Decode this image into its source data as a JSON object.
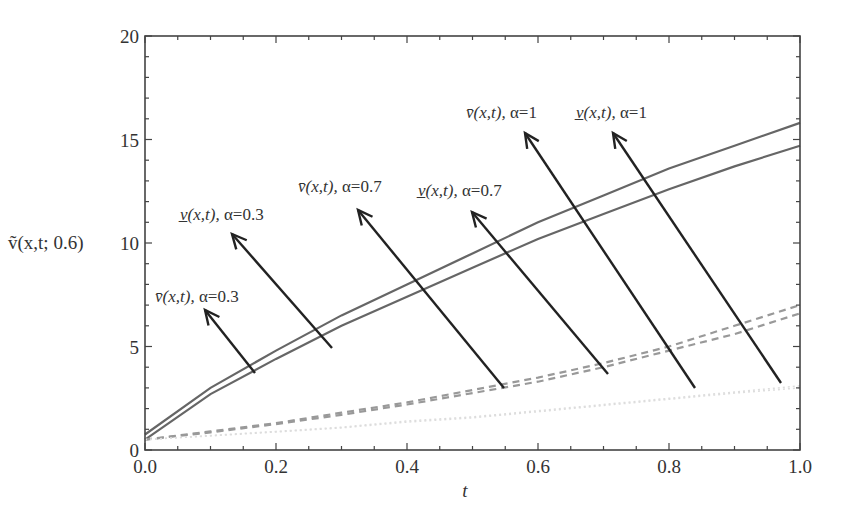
{
  "chart_data": {
    "type": "line",
    "title": "",
    "xlabel": "t",
    "ylabel": "ṽ(x,t; 0.6)",
    "xlim": [
      0,
      1
    ],
    "ylim": [
      0,
      20
    ],
    "xticks": [
      "0.0",
      "0.2",
      "0.4",
      "0.6",
      "0.8",
      "1.0"
    ],
    "yticks": [
      "0",
      "5",
      "10",
      "15",
      "20"
    ],
    "grid": false,
    "legend": "none (arrow annotations)",
    "x": [
      0,
      0.1,
      0.2,
      0.3,
      0.4,
      0.5,
      0.6,
      0.7,
      0.8,
      0.9,
      1.0
    ],
    "series": [
      {
        "name": "v̄(x,t), α=0.3",
        "style": "solid",
        "values": [
          0.75,
          3.0,
          4.8,
          6.5,
          8.0,
          9.5,
          11.0,
          12.3,
          13.6,
          14.7,
          15.8
        ]
      },
      {
        "name": "v̲(x,t), α=0.3",
        "style": "solid",
        "values": [
          0.5,
          2.7,
          4.4,
          6.0,
          7.4,
          8.8,
          10.2,
          11.4,
          12.6,
          13.7,
          14.7
        ]
      },
      {
        "name": "v̄(x,t), α=0.7",
        "style": "dashed",
        "values": [
          0.5,
          0.9,
          1.3,
          1.8,
          2.3,
          2.9,
          3.5,
          4.2,
          5.0,
          6.0,
          7.0
        ]
      },
      {
        "name": "v̲(x,t), α=0.7",
        "style": "dashed",
        "values": [
          0.5,
          0.85,
          1.25,
          1.7,
          2.2,
          2.75,
          3.3,
          4.0,
          4.8,
          5.6,
          6.6
        ]
      },
      {
        "name": "v̄(x,t), α=1",
        "style": "dotted-faint",
        "values": [
          0.5,
          0.7,
          0.9,
          1.1,
          1.4,
          1.6,
          1.9,
          2.2,
          2.5,
          2.8,
          3.1
        ]
      },
      {
        "name": "v̲(x,t), α=1",
        "style": "dotted-faint",
        "values": [
          0.5,
          0.68,
          0.87,
          1.07,
          1.35,
          1.55,
          1.85,
          2.15,
          2.45,
          2.75,
          3.0
        ]
      }
    ],
    "annotations": [
      {
        "label_var": "v̄(x,t), ",
        "label_alpha": "α=0.3",
        "text_x": 155,
        "text_y": 302,
        "arrow_from": [
          255,
          373
        ],
        "arrow_to": [
          205,
          310
        ]
      },
      {
        "label_var": "v̲(x,t), ",
        "label_alpha": "α=0.3",
        "text_x": 180,
        "text_y": 220,
        "arrow_from": [
          332,
          348
        ],
        "arrow_to": [
          232,
          234
        ]
      },
      {
        "label_var": "v̄(x,t), ",
        "label_alpha": "α=0.7",
        "text_x": 298,
        "text_y": 192,
        "arrow_from": [
          504,
          388
        ],
        "arrow_to": [
          358,
          210
        ]
      },
      {
        "label_var": "v̲(x,t), ",
        "label_alpha": "α=0.7",
        "text_x": 418,
        "text_y": 196,
        "arrow_from": [
          608,
          374
        ],
        "arrow_to": [
          472,
          212
        ]
      },
      {
        "label_var": "v̄(x,t), ",
        "label_alpha": "α=1",
        "text_x": 466,
        "text_y": 118,
        "arrow_from": [
          695,
          388
        ],
        "arrow_to": [
          525,
          133
        ]
      },
      {
        "label_var": "v̲(x,t), ",
        "label_alpha": "α=1",
        "text_x": 576,
        "text_y": 118,
        "arrow_from": [
          781,
          383
        ],
        "arrow_to": [
          613,
          133
        ]
      }
    ]
  }
}
